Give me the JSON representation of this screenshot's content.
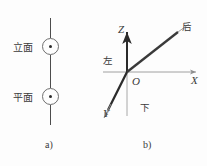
{
  "figure": {
    "panel_a": {
      "caption": "a)",
      "items": [
        {
          "label": "立面",
          "symbol": "point-circle-dot"
        },
        {
          "label": "平面",
          "symbol": "point-circle-dot"
        }
      ]
    },
    "panel_b": {
      "caption": "b)",
      "origin_label": "O",
      "axes": [
        {
          "name": "Z",
          "label": "Z",
          "direction": "up"
        },
        {
          "name": "X",
          "label": "X",
          "direction": "right"
        },
        {
          "name": "Y",
          "label": "Y",
          "direction": "lower-left"
        }
      ],
      "direction_labels": [
        {
          "name": "left",
          "label": "左"
        },
        {
          "name": "back",
          "label": "后"
        },
        {
          "name": "down",
          "label": "下"
        }
      ]
    }
  },
  "colors": {
    "background": "#fdfdfd",
    "dark_stroke": "#2b2b2b",
    "mid_stroke": "#4c4c4c",
    "light_stroke": "#a0a0a0",
    "text": "#3a3a3a"
  }
}
